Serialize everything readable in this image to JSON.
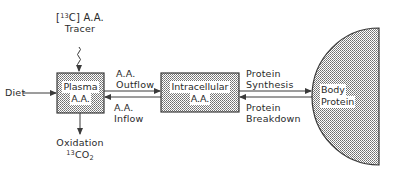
{
  "diagram": {
    "type": "compartment-model",
    "colors": {
      "stroke": "#3a3a3a",
      "fill_dots": "#6e6e6e",
      "background": "#ffffff"
    },
    "nodes": {
      "plasma": {
        "line1": "Plasma",
        "line2": "A.A."
      },
      "intracellular": {
        "line1": "Intracellular",
        "line2": "A.A."
      },
      "body_protein": {
        "line1": "Body",
        "line2": "Protein"
      }
    },
    "tracer": {
      "bracket_open": "[",
      "isotope_mass": "13",
      "element": "C",
      "bracket_close": "]",
      "suffix": " A.A.",
      "line2": "Tracer"
    },
    "diet": {
      "label": "Diet"
    },
    "oxidation": {
      "line1": "Oxidation",
      "isotope_mass": "13",
      "formula": "CO",
      "subscript": "2"
    },
    "flows": {
      "outflow": {
        "line1": "A.A.",
        "line2": "Outflow"
      },
      "inflow": {
        "line1": "A.A.",
        "line2": "Inflow"
      },
      "synthesis": {
        "line1": "Protein",
        "line2": "Synthesis"
      },
      "breakdown": {
        "line1": "Protein",
        "line2": "Breakdown"
      }
    }
  }
}
